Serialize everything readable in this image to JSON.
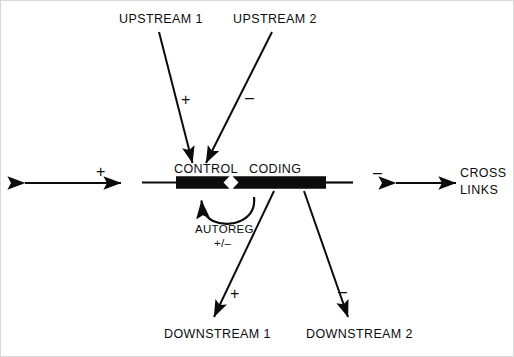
{
  "diagram": {
    "title_visible": false,
    "background_color": "#ffffff",
    "ink_color": "#0c0c0c",
    "border_color": "#d8d8d8",
    "gene": {
      "control_label": "CONTROL",
      "coding_label": "CODING",
      "bar_color": "#0c0c0c"
    },
    "upstream": [
      {
        "label": "UPSTREAM 1",
        "sign": "+"
      },
      {
        "label": "UPSTREAM 2",
        "sign": "–"
      }
    ],
    "downstream": [
      {
        "label": "DOWNSTREAM 1",
        "sign": "+"
      },
      {
        "label": "DOWNSTREAM 2",
        "sign": "–"
      }
    ],
    "autoregulation": {
      "label": "AUTOREG",
      "sign": "+/–"
    },
    "left_flank": {
      "sign": "+"
    },
    "right_flank": {
      "sign": "–",
      "label_line1": "CROSS",
      "label_line2": "LINKS"
    }
  }
}
